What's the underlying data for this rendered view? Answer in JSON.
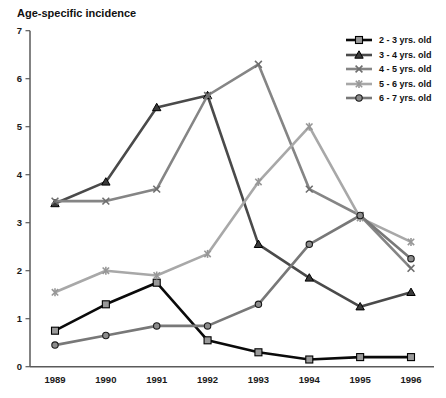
{
  "title": "Age-specific incidence",
  "chart_data": {
    "type": "line",
    "title": "Age-specific incidence",
    "xlabel": "",
    "ylabel": "",
    "x": [
      1989,
      1990,
      1991,
      1992,
      1993,
      1994,
      1995,
      1996
    ],
    "ylim": [
      0,
      7
    ],
    "yticks": [
      0,
      1,
      2,
      3,
      4,
      5,
      6,
      7
    ],
    "grid": false,
    "legend_position": "top-right",
    "axis_color": "#5a5a5a",
    "series": [
      {
        "name": "2 - 3 yrs. old",
        "marker": "square",
        "color": "#0a0a0a",
        "marker_fill": "#999999",
        "marker_stroke": "#000000",
        "values": [
          0.75,
          1.3,
          1.75,
          0.55,
          0.3,
          0.15,
          0.2,
          0.2
        ]
      },
      {
        "name": "3 - 4 yrs. old",
        "marker": "triangle",
        "color": "#4a4a4a",
        "marker_fill": "#3a3a3a",
        "marker_stroke": "#000000",
        "values": [
          3.4,
          3.85,
          5.4,
          5.65,
          2.55,
          1.85,
          1.25,
          1.55
        ]
      },
      {
        "name": "4 - 5 yrs. old",
        "marker": "x",
        "color": "#858585",
        "marker_fill": "none",
        "marker_stroke": "#6e6e6e",
        "values": [
          3.45,
          3.45,
          3.7,
          5.65,
          6.3,
          3.7,
          3.15,
          2.05
        ]
      },
      {
        "name": "5 - 6 yrs. old",
        "marker": "star",
        "color": "#a8a8a8",
        "marker_fill": "none",
        "marker_stroke": "#979797",
        "values": [
          1.55,
          2.0,
          1.9,
          2.35,
          3.85,
          5.0,
          3.1,
          2.6
        ]
      },
      {
        "name": "6 - 7 yrs. old",
        "marker": "circle",
        "color": "#787878",
        "marker_fill": "#8c8c8c",
        "marker_stroke": "#1a1a1a",
        "values": [
          0.45,
          0.65,
          0.85,
          0.85,
          1.3,
          2.55,
          3.15,
          2.25
        ]
      }
    ]
  }
}
